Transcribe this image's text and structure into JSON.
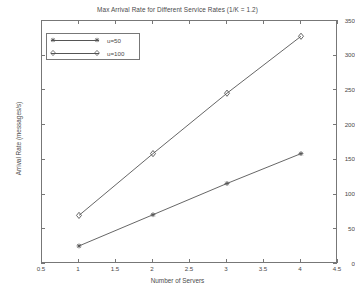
{
  "chart_data": {
    "type": "line",
    "title": "Max Arrival Rate for Different Service Rates (1/K = 1.2)",
    "xlabel": "Number of Servers",
    "ylabel": "Arrival Rate (messages/s)",
    "x": [
      1,
      2,
      3,
      4
    ],
    "xlim": [
      0.5,
      4.5
    ],
    "ylim": [
      0,
      350
    ],
    "xticks": [
      "0.5",
      "1",
      "1.5",
      "2",
      "2.5",
      "3",
      "3.5",
      "4",
      "4.5"
    ],
    "xtick_values": [
      0.5,
      1,
      1.5,
      2,
      2.5,
      3,
      3.5,
      4,
      4.5
    ],
    "yticks": [
      "0",
      "50",
      "100",
      "150",
      "200",
      "250",
      "300",
      "350"
    ],
    "ytick_values": [
      0,
      50,
      100,
      150,
      200,
      250,
      300,
      350
    ],
    "grid": false,
    "legend_position": "top-left",
    "series": [
      {
        "name": "u=50",
        "marker": "star",
        "marker_filled": true,
        "color": "#555555",
        "values": [
          26,
          71,
          116,
          159
        ]
      },
      {
        "name": "u=100",
        "marker": "diamond",
        "marker_filled": false,
        "color": "#555555",
        "values": [
          70,
          159,
          246,
          328
        ]
      }
    ]
  },
  "legend": {
    "entries": [
      {
        "label": "u=50"
      },
      {
        "label": "u=100"
      }
    ]
  },
  "colors": {
    "axis": "#777777",
    "line": "#555555",
    "text": "#4a4a4a",
    "background": "#ffffff"
  }
}
